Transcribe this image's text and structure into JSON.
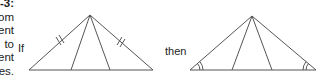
{
  "side_text": {
    "lines": [
      "-3:",
      "om",
      "ent",
      "to",
      "ent",
      "es."
    ]
  },
  "labels": {
    "if": "If",
    "then": "then"
  },
  "diagram": {
    "left_triangle": {
      "apex": [
        90,
        15
      ],
      "base_left": [
        29,
        70
      ],
      "base_right": [
        153,
        70
      ],
      "cevian_feet": [
        [
          71,
          70
        ],
        [
          110,
          70
        ]
      ],
      "marks": "double tick marks on both equal sides"
    },
    "right_triangle": {
      "apex": [
        252,
        16
      ],
      "base_left": [
        190,
        70
      ],
      "base_right": [
        316,
        70
      ],
      "cevian_feet": [
        [
          232,
          70
        ],
        [
          272,
          70
        ]
      ],
      "marks": "double arc marks on both base angles"
    },
    "stroke_color": "#555555"
  }
}
